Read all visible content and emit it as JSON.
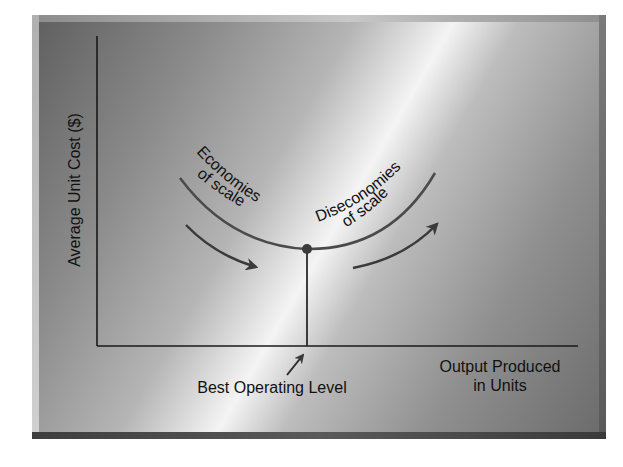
{
  "diagram": {
    "y_axis_label": "Average Unit Cost ($)",
    "x_axis_label_line1": "Output Produced",
    "x_axis_label_line2": "in Units",
    "left_region_line1": "Economies",
    "left_region_line2": "of scale",
    "right_region_line1": "Diseconomies",
    "right_region_line2": "of scale",
    "optimum_label": "Best Operating Level",
    "colors": {
      "curve": "#4a4a4a",
      "axes": "#1a1a1a",
      "text": "#111111"
    }
  }
}
